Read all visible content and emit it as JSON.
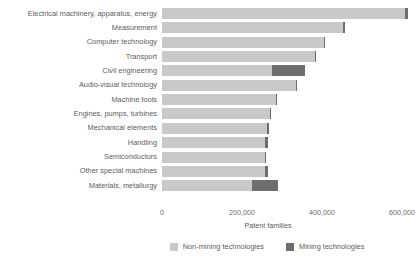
{
  "chart_data": {
    "type": "bar",
    "orientation": "horizontal",
    "stacked": true,
    "title": "",
    "xlabel": "Patent families",
    "ylabel": "",
    "xlim": [
      0,
      620000
    ],
    "xticks": [
      0,
      200000,
      400000,
      600000
    ],
    "xticklabels": [
      "0",
      "200,000",
      "400,000",
      "600,000"
    ],
    "grid": false,
    "legend_position": "bottom",
    "categories": [
      "Electrical machinery, apparatus, energy",
      "Measurement",
      "Computer technology",
      "Transport",
      "Civil engineering",
      "Audio-visual technology",
      "Machine tools",
      "Engines, pumps, turbines",
      "Mechanical elements",
      "Handling",
      "Semiconductors",
      "Other special machines",
      "Materials, metallurgy"
    ],
    "series": [
      {
        "name": "Non-mining technologies",
        "color": "#c9c9c9",
        "values": [
          608000,
          452000,
          404000,
          382000,
          275000,
          335000,
          284000,
          269000,
          262000,
          258000,
          257000,
          258000,
          225000
        ]
      },
      {
        "name": "Mining technologies",
        "color": "#6e6e6e",
        "values": [
          7000,
          6000,
          2000,
          4000,
          82000,
          1000,
          4000,
          2000,
          5000,
          6000,
          1000,
          6000,
          65000
        ]
      }
    ],
    "totals": [
      615000,
      458000,
      406000,
      386000,
      357000,
      336000,
      288000,
      271000,
      267000,
      264000,
      258000,
      264000,
      290000
    ]
  },
  "legend": {
    "items": [
      {
        "label": "Non-mining technologies",
        "color": "#c9c9c9",
        "swatch_name": "legend-swatch-non-mining"
      },
      {
        "label": "Mining technologies",
        "color": "#6e6e6e",
        "swatch_name": "legend-swatch-mining"
      }
    ]
  }
}
